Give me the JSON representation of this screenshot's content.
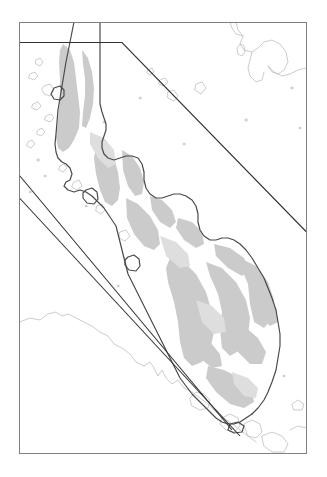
{
  "map": {
    "title": "",
    "domain": "Map",
    "canvas": {
      "width": 327,
      "height": 477,
      "background": "#ffffff"
    },
    "frame": {
      "name": "map-neatline",
      "x": 19.5,
      "y": 22.5,
      "width": 287,
      "height": 431,
      "stroke": "#808080",
      "stroke_width": 1,
      "fill": "none"
    },
    "colors": {
      "background": "#ffffff",
      "neatline": "#808080",
      "coastline_major": "#4a4a4a",
      "coastline_minor": "#b0b0b0",
      "study_boundary": "#333333",
      "terrain_shade": "#c9c9c9",
      "terrain_shade_light": "#dcdcdc",
      "island_fill": "#ffffff"
    },
    "legend": {
      "visible": false,
      "entries": []
    },
    "scalebar": {
      "visible": false,
      "label": ""
    },
    "north_arrow": {
      "visible": false,
      "label": ""
    },
    "graticule": {
      "visible": false,
      "labels": []
    },
    "annotations": [],
    "study_area_boundary": {
      "name": "study-area-polygon",
      "description": "angular study-area outline crossing the map frame",
      "stroke": "#333333",
      "stroke_width": 1.1,
      "points": "19.5,42.5 122,42.5 306.5,232 306.5,232 269,392 232,430 19.5,175.5"
    },
    "features": {
      "terrain_shaded": "true",
      "coastline_detail": "true",
      "small_islands": "true"
    }
  }
}
